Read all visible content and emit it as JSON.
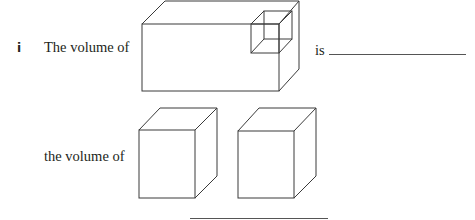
{
  "question": {
    "part_label": "i",
    "line1_prefix": "The volume of",
    "line1_suffix": "is",
    "line2_prefix": "the volume of"
  },
  "figures": [
    {
      "name": "large-cuboid-with-small-cube",
      "description": "cuboid with a small cube drawn at its top-right front corner"
    },
    {
      "name": "cuboid-left",
      "description": "tall cuboid"
    },
    {
      "name": "cuboid-right",
      "description": "tall cuboid"
    }
  ],
  "colors": {
    "stroke": "#3a3a3a",
    "text": "#231f20",
    "answer_line": "#555555"
  }
}
